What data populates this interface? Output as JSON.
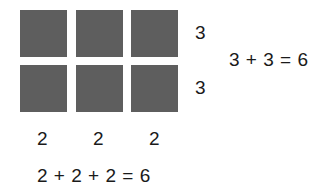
{
  "grid": {
    "rows": 2,
    "columns": 3,
    "square_color": "#5e5e5e"
  },
  "row_labels": [
    "3",
    "3"
  ],
  "column_labels": [
    "2",
    "2",
    "2"
  ],
  "row_equation": "3 + 3 = 6",
  "column_equation": "2 + 2 + 2 = 6"
}
